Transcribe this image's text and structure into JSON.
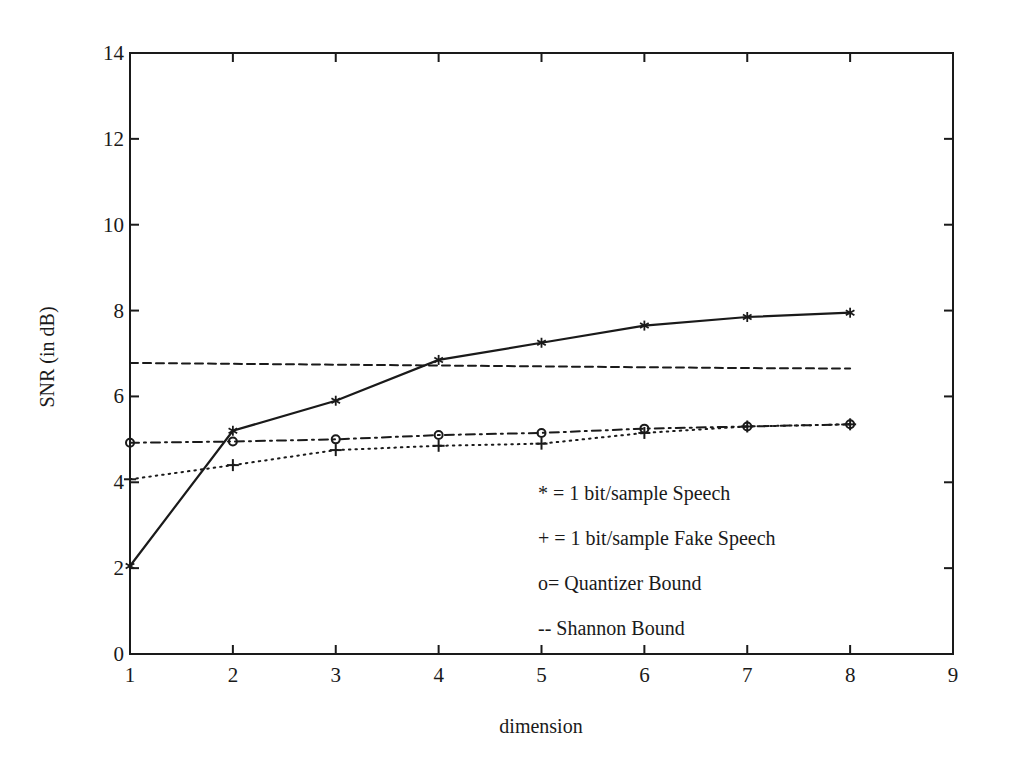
{
  "chart_data": {
    "type": "line",
    "title": "",
    "xlabel": "dimension",
    "ylabel": "SNR (in dB)",
    "xlim": [
      1,
      9
    ],
    "ylim": [
      0,
      14
    ],
    "xticks": [
      1,
      2,
      3,
      4,
      5,
      6,
      7,
      8,
      9
    ],
    "yticks": [
      0,
      2,
      4,
      6,
      8,
      10,
      12,
      14
    ],
    "grid": false,
    "legend_position": "lower right (inside plot)",
    "x": [
      1,
      2,
      3,
      4,
      5,
      6,
      7,
      8
    ],
    "series": [
      {
        "name": "1 bit/sample Speech",
        "marker": "*",
        "line_style": "solid",
        "values": [
          2.05,
          5.2,
          5.9,
          6.85,
          7.25,
          7.65,
          7.85,
          7.95
        ]
      },
      {
        "name": "1 bit/sample Fake Speech",
        "marker": "+",
        "line_style": "dotted",
        "values": [
          4.07,
          4.4,
          4.75,
          4.85,
          4.9,
          5.15,
          5.3,
          5.35
        ]
      },
      {
        "name": "Quantizer Bound",
        "marker": "o",
        "line_style": "dashdot",
        "values": [
          4.92,
          4.95,
          5.0,
          5.1,
          5.15,
          5.25,
          5.3,
          5.35
        ]
      },
      {
        "name": "Shannon Bound",
        "marker": "none",
        "line_style": "dashed",
        "values": [
          6.78,
          6.76,
          6.74,
          6.72,
          6.7,
          6.68,
          6.66,
          6.65
        ]
      }
    ],
    "legend": [
      "* = 1 bit/sample Speech",
      "+ = 1 bit/sample Fake Speech",
      "o= Quantizer Bound",
      "-- Shannon Bound"
    ]
  },
  "colors": {
    "ink": "#1a1a1a",
    "background": "#ffffff"
  }
}
